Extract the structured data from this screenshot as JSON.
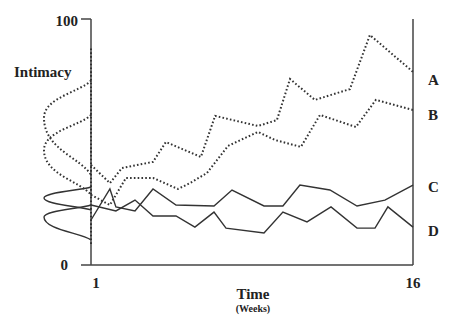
{
  "chart_data": {
    "type": "line",
    "title": "",
    "ylabel": "Intimacy",
    "xlabel": "Time",
    "xlabel_sub": "(Weeks)",
    "xlim": [
      1,
      16
    ],
    "ylim": [
      0,
      100
    ],
    "x_tick_labels": [
      "1",
      "16"
    ],
    "y_tick_labels": [
      "0",
      "100"
    ],
    "grid": false,
    "legend": "right-end labels",
    "series": [
      {
        "name": "A",
        "style": "dotted",
        "points": [
          [
            1,
            40.7
          ],
          [
            1.88,
            33.3
          ],
          [
            2.44,
            39.4
          ],
          [
            3.89,
            41.9
          ],
          [
            4.49,
            50.0
          ],
          [
            6.12,
            43.9
          ],
          [
            6.78,
            60.6
          ],
          [
            8.78,
            56.5
          ],
          [
            9.66,
            58.9
          ],
          [
            10.27,
            75.6
          ],
          [
            11.43,
            67.1
          ],
          [
            13.06,
            71.5
          ],
          [
            13.99,
            93.5
          ],
          [
            16,
            78.5
          ]
        ],
        "initial_distribution": {
          "center": 59.8,
          "spread": [
            36.6,
            75.0
          ],
          "shape": "wide"
        }
      },
      {
        "name": "B",
        "style": "dotted",
        "points": [
          [
            1,
            28.5
          ],
          [
            1.88,
            24.4
          ],
          [
            2.63,
            35.4
          ],
          [
            3.89,
            35.4
          ],
          [
            5.05,
            30.9
          ],
          [
            5.61,
            33.3
          ],
          [
            6.4,
            37.4
          ],
          [
            7.38,
            48.4
          ],
          [
            8.78,
            54.1
          ],
          [
            9.57,
            50.8
          ],
          [
            10.78,
            48.0
          ],
          [
            11.67,
            61.0
          ],
          [
            13.34,
            56.1
          ],
          [
            14.27,
            67.1
          ],
          [
            16,
            63.0
          ]
        ],
        "initial_distribution": {
          "center": 46.7,
          "spread": [
            28.5,
            61.0
          ],
          "shape": "wide"
        }
      },
      {
        "name": "C",
        "style": "solid",
        "points": [
          [
            1,
            18.3
          ],
          [
            1.88,
            30.9
          ],
          [
            2.16,
            23.6
          ],
          [
            3.05,
            22.0
          ],
          [
            3.89,
            30.9
          ],
          [
            4.96,
            24.4
          ],
          [
            6.73,
            24.0
          ],
          [
            7.57,
            30.5
          ],
          [
            9.06,
            24.0
          ],
          [
            9.94,
            24.0
          ],
          [
            10.73,
            32.5
          ],
          [
            12.13,
            30.5
          ],
          [
            13.39,
            24.0
          ],
          [
            14.69,
            26.4
          ],
          [
            16,
            32.5
          ]
        ],
        "initial_distribution": {
          "center": 27.2,
          "spread": [
            22.4,
            31.7
          ],
          "shape": "narrow"
        }
      },
      {
        "name": "D",
        "style": "solid",
        "points": [
          [
            1,
            24.4
          ],
          [
            2.16,
            22.0
          ],
          [
            3.05,
            26.4
          ],
          [
            3.89,
            19.9
          ],
          [
            4.96,
            19.9
          ],
          [
            5.84,
            15.4
          ],
          [
            6.73,
            21.5
          ],
          [
            7.29,
            15.0
          ],
          [
            9.06,
            13.0
          ],
          [
            9.94,
            21.5
          ],
          [
            11.06,
            17.5
          ],
          [
            12.18,
            23.6
          ],
          [
            13.39,
            15.0
          ],
          [
            14.23,
            15.0
          ],
          [
            14.83,
            23.6
          ],
          [
            16,
            15.4
          ]
        ],
        "initial_distribution": {
          "center": 19.5,
          "spread": [
            10.2,
            24.4
          ],
          "shape": "narrow"
        }
      }
    ]
  }
}
